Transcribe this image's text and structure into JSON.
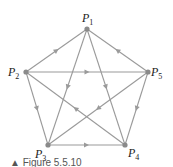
{
  "diagram": {
    "type": "directed-graph",
    "nodes": [
      {
        "id": "P1",
        "label": "P",
        "sub": "1",
        "x": 87,
        "y": 29,
        "lx": 82,
        "ly": 22
      },
      {
        "id": "P2",
        "label": "P",
        "sub": "2",
        "x": 26,
        "y": 72,
        "lx": 8,
        "ly": 76
      },
      {
        "id": "P3",
        "label": "P",
        "sub": "3",
        "x": 48,
        "y": 145,
        "lx": 35,
        "ly": 158
      },
      {
        "id": "P4",
        "label": "P",
        "sub": "4",
        "x": 125,
        "y": 145,
        "lx": 128,
        "ly": 157
      },
      {
        "id": "P5",
        "label": "P",
        "sub": "5",
        "x": 148,
        "y": 72,
        "lx": 151,
        "ly": 76
      }
    ],
    "edges": [
      {
        "from": "P2",
        "to": "P1"
      },
      {
        "from": "P5",
        "to": "P1"
      },
      {
        "from": "P2",
        "to": "P5"
      },
      {
        "from": "P2",
        "to": "P3"
      },
      {
        "from": "P5",
        "to": "P4"
      },
      {
        "from": "P3",
        "to": "P4"
      },
      {
        "from": "P1",
        "to": "P3"
      },
      {
        "from": "P1",
        "to": "P4"
      },
      {
        "from": "P4",
        "to": "P2"
      },
      {
        "from": "P5",
        "to": "P3"
      }
    ],
    "colors": {
      "edge": "#9a9a9a",
      "node": "#8a8a8a",
      "label": "#222222"
    }
  },
  "caption": "▲ Figure 5.5.10"
}
